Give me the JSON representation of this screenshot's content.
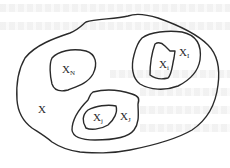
{
  "diagram": {
    "regions": [
      {
        "id": "outer",
        "label": "X",
        "sub": ""
      },
      {
        "id": "xn",
        "label": "X",
        "sub": "N"
      },
      {
        "id": "xI",
        "label": "X",
        "sub": "I"
      },
      {
        "id": "xi",
        "label": "X",
        "sub": "i"
      },
      {
        "id": "xJ",
        "label": "X",
        "sub": "J"
      },
      {
        "id": "xj",
        "label": "X",
        "sub": "j"
      }
    ],
    "colors": {
      "stroke": "#2a2a2a",
      "background": "#ffffff"
    }
  }
}
